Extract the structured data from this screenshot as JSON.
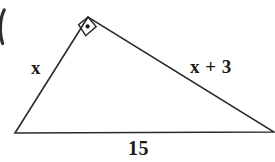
{
  "figure": {
    "type": "right-triangle-diagram",
    "background_color": "#ffffff",
    "stroke_color": "#2b2b2b",
    "stroke_width": 1.6,
    "width": 275,
    "height": 162
  },
  "triangle": {
    "vertices": {
      "apex": {
        "x": 88,
        "y": 17
      },
      "bottom_left": {
        "x": 15,
        "y": 133
      },
      "bottom_right": {
        "x": 274,
        "y": 132
      }
    },
    "right_angle_vertex": "apex"
  },
  "right_angle_marker": {
    "icon": "right-angle-square-dot",
    "size": 17,
    "dot_radius": 2.1,
    "center": {
      "x": 90,
      "y": 27
    }
  },
  "labels": {
    "left_leg": "x",
    "right_leg": "x + 3",
    "base": "15"
  },
  "edge_artifact": {
    "present": true,
    "description": "clipped-arc-left-edge"
  }
}
